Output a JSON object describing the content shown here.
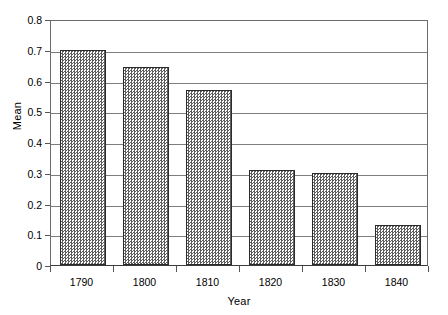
{
  "chart_data": {
    "type": "bar",
    "title": "",
    "xlabel": "Year",
    "ylabel": "Mean",
    "categories": [
      "1790",
      "1800",
      "1810",
      "1820",
      "1830",
      "1840"
    ],
    "values": [
      0.7,
      0.645,
      0.57,
      0.31,
      0.3,
      0.13
    ],
    "series": [
      {
        "name": "Mean",
        "values": [
          0.7,
          0.645,
          0.57,
          0.31,
          0.3,
          0.13
        ]
      }
    ],
    "ylim": [
      0,
      0.8
    ],
    "ytick_values": [
      0,
      0.1,
      0.2,
      0.3,
      0.4,
      0.5,
      0.6,
      0.7,
      0.8
    ],
    "ytick_labels": [
      "0",
      "0.1",
      "0.2",
      "0.3",
      "0.4",
      "0.5",
      "0.6",
      "0.7",
      "0.8"
    ],
    "grid": "horizontal",
    "legend": "none",
    "bar_fill": "cross-hatch-gray",
    "colors": {
      "bar_fill": "#5d5d5d",
      "bar_edge": "#2b2b2b",
      "gridline": "#7d7d7d",
      "frame": "#6b6b6b",
      "axis_text": "#000000",
      "background": "#ffffff"
    }
  }
}
